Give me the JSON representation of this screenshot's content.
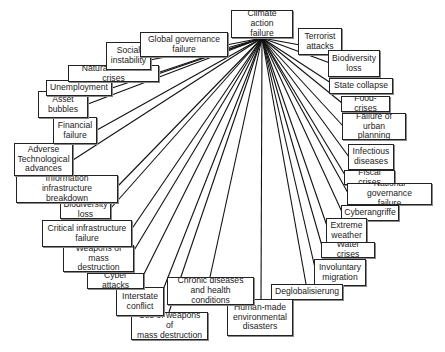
{
  "diagram": {
    "type": "radial-star",
    "hub": {
      "id": "hub",
      "label": "Climate action\nfailure",
      "x": 231,
      "y": 10,
      "w": 62,
      "h": 28,
      "anchor": [
        262,
        38
      ]
    },
    "nodes": [
      {
        "id": "n1",
        "label": "Terrorist\nattacks",
        "x": 298,
        "y": 28,
        "w": 44,
        "h": 27,
        "end": [
          300,
          45
        ]
      },
      {
        "id": "n2",
        "label": "Biodiversity\nloss",
        "x": 328,
        "y": 50,
        "w": 52,
        "h": 27,
        "end": [
          330,
          63
        ]
      },
      {
        "id": "n3",
        "label": "State collapse",
        "x": 329,
        "y": 78,
        "w": 64,
        "h": 16,
        "end": [
          331,
          83
        ]
      },
      {
        "id": "n4",
        "label": "Food-crises",
        "x": 341,
        "y": 96,
        "w": 49,
        "h": 16,
        "end": [
          342,
          103
        ]
      },
      {
        "id": "n5",
        "label": "Failure of\nurban planning",
        "x": 342,
        "y": 113,
        "w": 64,
        "h": 27,
        "end": [
          343,
          126
        ]
      },
      {
        "id": "n6",
        "label": "Infectious\ndiseases",
        "x": 348,
        "y": 144,
        "w": 46,
        "h": 26,
        "end": [
          349,
          157
        ]
      },
      {
        "id": "n7",
        "label": "Fiscal crises",
        "x": 344,
        "y": 170,
        "w": 51,
        "h": 15,
        "end": [
          345,
          175
        ]
      },
      {
        "id": "n8",
        "label": "National governance\nfailure",
        "x": 347,
        "y": 183,
        "w": 85,
        "h": 22,
        "end": [
          348,
          193
        ]
      },
      {
        "id": "n9",
        "label": "Cyberangriffe",
        "x": 341,
        "y": 205,
        "w": 58,
        "h": 16,
        "end": [
          342,
          212
        ]
      },
      {
        "id": "n10",
        "label": "Extreme\nweather",
        "x": 326,
        "y": 218,
        "w": 41,
        "h": 26,
        "end": [
          327,
          226
        ]
      },
      {
        "id": "n11",
        "label": "Water crises",
        "x": 321,
        "y": 242,
        "w": 54,
        "h": 16,
        "end": [
          322,
          246
        ]
      },
      {
        "id": "n12",
        "label": "Involuntary\nmigration",
        "x": 314,
        "y": 259,
        "w": 52,
        "h": 27,
        "end": [
          315,
          268
        ]
      },
      {
        "id": "n13",
        "label": "Deglobalisierung",
        "x": 271,
        "y": 284,
        "w": 72,
        "h": 16,
        "end": [
          306,
          284
        ]
      },
      {
        "id": "n14",
        "label": "Human-made\nenvironmental\ndisasters",
        "x": 227,
        "y": 299,
        "w": 66,
        "h": 37,
        "end": [
          261,
          299
        ]
      },
      {
        "id": "n15",
        "label": "Chronic diseases\nand health conditions",
        "x": 167,
        "y": 277,
        "w": 87,
        "h": 28,
        "end": [
          210,
          277
        ]
      },
      {
        "id": "n16",
        "label": "Use of weapons of\nmass destruction",
        "x": 131,
        "y": 312,
        "w": 77,
        "h": 28,
        "end": [
          169,
          312
        ]
      },
      {
        "id": "n17",
        "label": "Interstate\nconflict",
        "x": 116,
        "y": 287,
        "w": 48,
        "h": 29,
        "end": [
          163,
          290
        ]
      },
      {
        "id": "n18",
        "label": "Cyber attacks",
        "x": 87,
        "y": 273,
        "w": 57,
        "h": 16,
        "end": [
          143,
          276
        ]
      },
      {
        "id": "n19",
        "label": "Weapons of\nmass destruction",
        "x": 63,
        "y": 245,
        "w": 71,
        "h": 27,
        "end": [
          133,
          252
        ]
      },
      {
        "id": "n20",
        "label": "Critical infrastructure\nfailure",
        "x": 42,
        "y": 220,
        "w": 90,
        "h": 27,
        "end": [
          131,
          230
        ]
      },
      {
        "id": "n21",
        "label": "Biodiversity\nloss",
        "x": 60,
        "y": 201,
        "w": 51,
        "h": 18,
        "end": [
          111,
          208
        ]
      },
      {
        "id": "n22",
        "label": "Information\ninfrastructure breakdown",
        "x": 16,
        "y": 175,
        "w": 102,
        "h": 28,
        "end": [
          117,
          187
        ]
      },
      {
        "id": "n23",
        "label": "Adverse\nTechnological\nadvances",
        "x": 14,
        "y": 143,
        "w": 59,
        "h": 33,
        "end": [
          73,
          160
        ]
      },
      {
        "id": "n24",
        "label": "Financial\nfailure",
        "x": 53,
        "y": 117,
        "w": 44,
        "h": 27,
        "end": [
          97,
          130
        ]
      },
      {
        "id": "n25",
        "label": "Asset\nbubbles",
        "x": 38,
        "y": 91,
        "w": 50,
        "h": 27,
        "end": [
          88,
          104
        ]
      },
      {
        "id": "n26",
        "label": "Unemployment",
        "x": 46,
        "y": 80,
        "w": 66,
        "h": 16,
        "end": [
          112,
          88
        ]
      },
      {
        "id": "n27",
        "label": "Natural resource crises",
        "x": 68,
        "y": 65,
        "w": 91,
        "h": 17,
        "end": [
          158,
          74
        ]
      },
      {
        "id": "n28",
        "label": "Social\ninstability",
        "x": 106,
        "y": 42,
        "w": 45,
        "h": 28,
        "end": [
          150,
          60
        ]
      },
      {
        "id": "n29",
        "label": "Global governance\nfailure",
        "x": 140,
        "y": 32,
        "w": 88,
        "h": 25,
        "end": [
          227,
          48
        ]
      }
    ]
  }
}
